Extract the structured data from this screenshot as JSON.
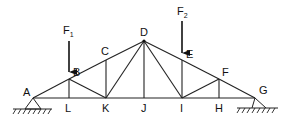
{
  "diagram": {
    "type": "truss",
    "nodes": {
      "A": {
        "label": "A",
        "x": 33,
        "y": 98
      },
      "B": {
        "label": "B",
        "x": 69,
        "y": 79
      },
      "C": {
        "label": "C",
        "x": 106,
        "y": 60
      },
      "D": {
        "label": "D",
        "x": 144,
        "y": 41
      },
      "E": {
        "label": "E",
        "x": 182,
        "y": 60
      },
      "F": {
        "label": "F",
        "x": 219,
        "y": 79
      },
      "G": {
        "label": "G",
        "x": 255,
        "y": 98
      },
      "H": {
        "label": "H",
        "x": 219,
        "y": 98
      },
      "I": {
        "label": "I",
        "x": 182,
        "y": 98
      },
      "J": {
        "label": "J",
        "x": 144,
        "y": 98
      },
      "K": {
        "label": "K",
        "x": 106,
        "y": 98
      },
      "L": {
        "label": "L",
        "x": 69,
        "y": 98
      }
    },
    "members": [
      [
        "A",
        "B"
      ],
      [
        "B",
        "C"
      ],
      [
        "C",
        "D"
      ],
      [
        "D",
        "E"
      ],
      [
        "E",
        "F"
      ],
      [
        "F",
        "G"
      ],
      [
        "A",
        "L"
      ],
      [
        "L",
        "K"
      ],
      [
        "K",
        "J"
      ],
      [
        "J",
        "I"
      ],
      [
        "I",
        "H"
      ],
      [
        "H",
        "G"
      ],
      [
        "B",
        "L"
      ],
      [
        "B",
        "K"
      ],
      [
        "C",
        "K"
      ],
      [
        "K",
        "D"
      ],
      [
        "D",
        "J"
      ],
      [
        "D",
        "I"
      ],
      [
        "E",
        "I"
      ],
      [
        "I",
        "F"
      ],
      [
        "F",
        "H"
      ]
    ],
    "forces": [
      {
        "label": "F",
        "subscript": "1",
        "at": "B"
      },
      {
        "label": "F",
        "subscript": "2",
        "at": "E"
      }
    ],
    "supports": [
      "A",
      "G"
    ]
  }
}
